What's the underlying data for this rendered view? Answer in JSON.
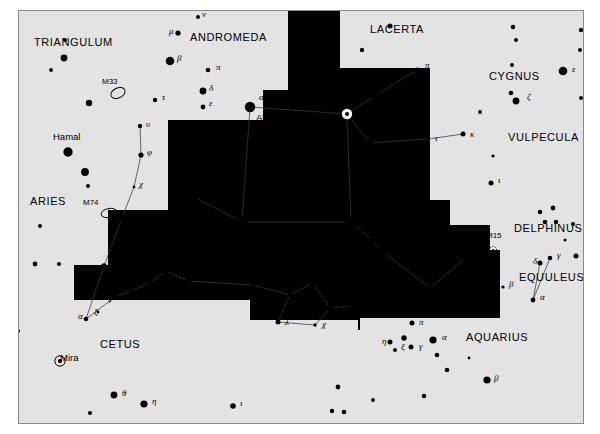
{
  "chart": {
    "frame": {
      "x": 18,
      "y": 10,
      "w": 566,
      "h": 414,
      "border_color": "#8a8a8a",
      "background": "#ffffff"
    },
    "milkyway_color": "#e3e3e3",
    "star_color": "#000000",
    "line_color": "#3a3a3a"
  },
  "constellations": [
    {
      "name": "TRIANGULUM",
      "x": 34,
      "y": 46
    },
    {
      "name": "ANDROMEDA",
      "x": 190,
      "y": 41
    },
    {
      "name": "LACERTA",
      "x": 370,
      "y": 33
    },
    {
      "name": "CYGNUS",
      "x": 489,
      "y": 80
    },
    {
      "name": "VULPECULA",
      "x": 508,
      "y": 141
    },
    {
      "name": "PEGASUS",
      "x": 366,
      "y": 193
    },
    {
      "name": "DELPHINUS",
      "x": 514,
      "y": 232
    },
    {
      "name": "EQUULEUS",
      "x": 519,
      "y": 281
    },
    {
      "name": "ARIES",
      "x": 30,
      "y": 205
    },
    {
      "name": "PISCES",
      "x": 163,
      "y": 220
    },
    {
      "name": "CETUS",
      "x": 100,
      "y": 348
    },
    {
      "name": "AQUARIUS",
      "x": 466,
      "y": 341
    }
  ],
  "named_stars": [
    {
      "name": "Alpheratz",
      "x": 256,
      "y": 121
    },
    {
      "name": "Markab",
      "x": 330,
      "y": 231
    },
    {
      "name": "Hamal",
      "x": 53,
      "y": 140
    },
    {
      "name": "Mira",
      "x": 60,
      "y": 361
    },
    {
      "name": "TX",
      "x": 277,
      "y": 313
    }
  ],
  "deep_sky_objects": [
    {
      "label": "M33",
      "x": 102,
      "y": 84,
      "mx": 118,
      "my": 93,
      "rx": 7.5,
      "ry": 5,
      "rot": -25,
      "kind": "galaxy"
    },
    {
      "label": "M74",
      "x": 83,
      "y": 205,
      "mx": 109,
      "my": 213,
      "rx": 8,
      "ry": 4.5,
      "rot": -12,
      "kind": "galaxy"
    },
    {
      "label": "M15",
      "x": 486,
      "y": 238,
      "mx": 493,
      "my": 250,
      "rx": 3.6,
      "ry": 3.6,
      "rot": 0,
      "kind": "cluster"
    }
  ],
  "greek_labels": [
    {
      "g": "ν",
      "x": 202,
      "y": 17
    },
    {
      "g": "μ",
      "x": 169,
      "y": 34
    },
    {
      "g": "β",
      "x": 177,
      "y": 61
    },
    {
      "g": "π",
      "x": 216,
      "y": 70
    },
    {
      "g": "δ",
      "x": 209,
      "y": 91
    },
    {
      "g": "ε",
      "x": 209,
      "y": 106
    },
    {
      "g": "τ",
      "x": 162,
      "y": 100
    },
    {
      "g": "υ",
      "x": 146,
      "y": 127
    },
    {
      "g": "φ",
      "x": 147,
      "y": 155
    },
    {
      "g": "χ",
      "x": 139,
      "y": 187
    },
    {
      "g": "η",
      "x": 129,
      "y": 218
    },
    {
      "g": "ο",
      "x": 112,
      "y": 266
    },
    {
      "g": "α",
      "x": 259,
      "y": 100
    },
    {
      "g": "β",
      "x": 345,
      "y": 102
    },
    {
      "g": "γ",
      "x": 234,
      "y": 222
    },
    {
      "g": "α",
      "x": 356,
      "y": 218
    },
    {
      "g": "π",
      "x": 425,
      "y": 68
    },
    {
      "g": "η",
      "x": 389,
      "y": 97
    },
    {
      "g": "μ",
      "x": 363,
      "y": 146
    },
    {
      "g": "λ",
      "x": 383,
      "y": 150
    },
    {
      "g": "ι",
      "x": 435,
      "y": 141
    },
    {
      "g": "κ",
      "x": 470,
      "y": 137
    },
    {
      "g": "ξ",
      "x": 379,
      "y": 240
    },
    {
      "g": "ζ",
      "x": 390,
      "y": 251
    },
    {
      "g": "θ",
      "x": 434,
      "y": 279
    },
    {
      "g": "ε",
      "x": 474,
      "y": 255
    },
    {
      "g": "ι",
      "x": 498,
      "y": 183
    },
    {
      "g": "ε",
      "x": 572,
      "y": 72
    },
    {
      "g": "ζ",
      "x": 527,
      "y": 100
    },
    {
      "g": "δ",
      "x": 533,
      "y": 264
    },
    {
      "g": "γ",
      "x": 557,
      "y": 258
    },
    {
      "g": "β",
      "x": 509,
      "y": 287
    },
    {
      "g": "α",
      "x": 540,
      "y": 300
    },
    {
      "g": "α",
      "x": 78,
      "y": 319
    },
    {
      "g": "ξ",
      "x": 94,
      "y": 315
    },
    {
      "g": "ν",
      "x": 108,
      "y": 303
    },
    {
      "g": "μ",
      "x": 127,
      "y": 298
    },
    {
      "g": "ζ",
      "x": 155,
      "y": 288
    },
    {
      "g": "ε",
      "x": 172,
      "y": 276
    },
    {
      "g": "δ",
      "x": 191,
      "y": 288
    },
    {
      "g": "ω",
      "x": 260,
      "y": 288
    },
    {
      "g": "ι",
      "x": 297,
      "y": 297
    },
    {
      "g": "θ",
      "x": 320,
      "y": 283
    },
    {
      "g": "λ",
      "x": 285,
      "y": 325
    },
    {
      "g": "χ",
      "x": 322,
      "y": 327
    },
    {
      "g": "γ",
      "x": 338,
      "y": 308
    },
    {
      "g": "β",
      "x": 357,
      "y": 308
    },
    {
      "g": "π",
      "x": 419,
      "y": 325
    },
    {
      "g": "η",
      "x": 382,
      "y": 344
    },
    {
      "g": "ξ",
      "x": 401,
      "y": 350
    },
    {
      "g": "γ",
      "x": 419,
      "y": 349
    },
    {
      "g": "α",
      "x": 442,
      "y": 340
    },
    {
      "g": "β",
      "x": 494,
      "y": 381
    },
    {
      "g": "θ",
      "x": 122,
      "y": 396
    },
    {
      "g": "η",
      "x": 152,
      "y": 404
    },
    {
      "g": "ι",
      "x": 240,
      "y": 406
    }
  ],
  "stars": [
    {
      "x": 198,
      "y": 17,
      "r": 2.0
    },
    {
      "x": 178,
      "y": 33,
      "r": 2.6
    },
    {
      "x": 170,
      "y": 61,
      "r": 4.3
    },
    {
      "x": 208,
      "y": 70,
      "r": 2.3
    },
    {
      "x": 203,
      "y": 91,
      "r": 3.4
    },
    {
      "x": 203,
      "y": 107,
      "r": 2.4
    },
    {
      "x": 155,
      "y": 100,
      "r": 2.2
    },
    {
      "x": 140,
      "y": 126,
      "r": 2.2
    },
    {
      "x": 141,
      "y": 155,
      "r": 2.6
    },
    {
      "x": 134,
      "y": 187,
      "r": 1.4
    },
    {
      "x": 122,
      "y": 218,
      "r": 3.5
    },
    {
      "x": 104,
      "y": 266,
      "r": 2.7
    },
    {
      "x": 65,
      "y": 40,
      "r": 2.0
    },
    {
      "x": 64,
      "y": 58,
      "r": 3.4
    },
    {
      "x": 51,
      "y": 70,
      "r": 1.9
    },
    {
      "x": 89,
      "y": 103,
      "r": 3.2
    },
    {
      "x": 68,
      "y": 152,
      "r": 4.7
    },
    {
      "x": 85,
      "y": 172,
      "r": 3.9
    },
    {
      "x": 88,
      "y": 186,
      "r": 2.0
    },
    {
      "x": 35,
      "y": 264,
      "r": 2.4
    },
    {
      "x": 59,
      "y": 264,
      "r": 2.0
    },
    {
      "x": 18,
      "y": 331,
      "r": 2.1
    },
    {
      "x": 250,
      "y": 107,
      "r": 5.2
    },
    {
      "x": 347,
      "y": 114,
      "r": 5.6
    },
    {
      "x": 242,
      "y": 222,
      "r": 5.2
    },
    {
      "x": 351,
      "y": 222,
      "r": 5.4
    },
    {
      "x": 376,
      "y": 95,
      "r": 4.1
    },
    {
      "x": 417,
      "y": 70,
      "r": 2.5
    },
    {
      "x": 370,
      "y": 143,
      "r": 3.0
    },
    {
      "x": 377,
      "y": 152,
      "r": 2.3
    },
    {
      "x": 428,
      "y": 139,
      "r": 2.2
    },
    {
      "x": 463,
      "y": 134,
      "r": 2.5
    },
    {
      "x": 372,
      "y": 240,
      "r": 2.6
    },
    {
      "x": 382,
      "y": 251,
      "r": 4.0
    },
    {
      "x": 430,
      "y": 288,
      "r": 2.8
    },
    {
      "x": 437,
      "y": 298,
      "r": 1.5
    },
    {
      "x": 467,
      "y": 257,
      "r": 5.0
    },
    {
      "x": 491,
      "y": 183,
      "r": 2.5
    },
    {
      "x": 390,
      "y": 26,
      "r": 2.5
    },
    {
      "x": 362,
      "y": 50,
      "r": 2.2
    },
    {
      "x": 513,
      "y": 27,
      "r": 2.3
    },
    {
      "x": 516,
      "y": 40,
      "r": 2.0
    },
    {
      "x": 512,
      "y": 65,
      "r": 2.0
    },
    {
      "x": 511,
      "y": 93,
      "r": 2.3
    },
    {
      "x": 516,
      "y": 101,
      "r": 3.4
    },
    {
      "x": 563,
      "y": 71,
      "r": 4.3
    },
    {
      "x": 581,
      "y": 30,
      "r": 2.2
    },
    {
      "x": 580,
      "y": 50,
      "r": 2.0
    },
    {
      "x": 581,
      "y": 98,
      "r": 2.0
    },
    {
      "x": 591,
      "y": 100,
      "r": 2.1
    },
    {
      "x": 493,
      "y": 156,
      "r": 1.6
    },
    {
      "x": 480,
      "y": 112,
      "r": 1.9
    },
    {
      "x": 540,
      "y": 212,
      "r": 2.3
    },
    {
      "x": 553,
      "y": 208,
      "r": 2.4
    },
    {
      "x": 545,
      "y": 222,
      "r": 2.3
    },
    {
      "x": 556,
      "y": 222,
      "r": 2.2
    },
    {
      "x": 573,
      "y": 224,
      "r": 2.1
    },
    {
      "x": 565,
      "y": 240,
      "r": 1.5
    },
    {
      "x": 576,
      "y": 256,
      "r": 2.5
    },
    {
      "x": 540,
      "y": 263,
      "r": 2.5
    },
    {
      "x": 550,
      "y": 258,
      "r": 2.3
    },
    {
      "x": 503,
      "y": 287,
      "r": 1.6
    },
    {
      "x": 533,
      "y": 300,
      "r": 2.4
    },
    {
      "x": 86,
      "y": 319,
      "r": 2.3
    },
    {
      "x": 98,
      "y": 312,
      "r": 1.4
    },
    {
      "x": 115,
      "y": 297,
      "r": 2.7
    },
    {
      "x": 131,
      "y": 291,
      "r": 1.6
    },
    {
      "x": 150,
      "y": 283,
      "r": 1.7
    },
    {
      "x": 166,
      "y": 271,
      "r": 3.0
    },
    {
      "x": 188,
      "y": 281,
      "r": 2.8
    },
    {
      "x": 253,
      "y": 285,
      "r": 2.2
    },
    {
      "x": 290,
      "y": 295,
      "r": 2.5
    },
    {
      "x": 313,
      "y": 283,
      "r": 3.0
    },
    {
      "x": 278,
      "y": 322,
      "r": 2.5
    },
    {
      "x": 315,
      "y": 325,
      "r": 1.7
    },
    {
      "x": 330,
      "y": 308,
      "r": 3.0
    },
    {
      "x": 350,
      "y": 306,
      "r": 2.6
    },
    {
      "x": 323,
      "y": 298,
      "r": 1.4
    },
    {
      "x": 412,
      "y": 323,
      "r": 2.5
    },
    {
      "x": 390,
      "y": 342,
      "r": 2.5
    },
    {
      "x": 404,
      "y": 338,
      "r": 2.7
    },
    {
      "x": 395,
      "y": 350,
      "r": 2.0
    },
    {
      "x": 411,
      "y": 347,
      "r": 2.5
    },
    {
      "x": 433,
      "y": 340,
      "r": 3.6
    },
    {
      "x": 437,
      "y": 355,
      "r": 2.3
    },
    {
      "x": 428,
      "y": 309,
      "r": 1.6
    },
    {
      "x": 487,
      "y": 380,
      "r": 3.6
    },
    {
      "x": 469,
      "y": 358,
      "r": 1.4
    },
    {
      "x": 424,
      "y": 396,
      "r": 2.2
    },
    {
      "x": 447,
      "y": 370,
      "r": 2.3
    },
    {
      "x": 60,
      "y": 361,
      "r": 2.0
    },
    {
      "x": 114,
      "y": 395,
      "r": 3.4
    },
    {
      "x": 144,
      "y": 404,
      "r": 3.6
    },
    {
      "x": 90,
      "y": 413,
      "r": 2.1
    },
    {
      "x": 233,
      "y": 406,
      "r": 2.8
    },
    {
      "x": 332,
      "y": 411,
      "r": 2.2
    },
    {
      "x": 344,
      "y": 412,
      "r": 2.3
    },
    {
      "x": 338,
      "y": 387,
      "r": 2.4
    },
    {
      "x": 373,
      "y": 400,
      "r": 1.9
    },
    {
      "x": 40,
      "y": 226,
      "r": 2.0
    },
    {
      "x": 196,
      "y": 198,
      "r": 1.3
    },
    {
      "x": 181,
      "y": 163,
      "r": 3.0
    },
    {
      "x": 197,
      "y": 158,
      "r": 3.2
    },
    {
      "x": 291,
      "y": 60,
      "r": 1.8
    }
  ],
  "lines": [
    [
      250,
      107,
      347,
      114
    ],
    [
      250,
      107,
      242,
      222
    ],
    [
      242,
      222,
      351,
      222
    ],
    [
      351,
      222,
      347,
      114
    ],
    [
      347,
      114,
      376,
      95
    ],
    [
      376,
      95,
      417,
      70
    ],
    [
      347,
      114,
      370,
      143
    ],
    [
      370,
      143,
      428,
      139
    ],
    [
      428,
      139,
      463,
      134
    ],
    [
      351,
      222,
      372,
      240
    ],
    [
      372,
      240,
      382,
      251
    ],
    [
      382,
      251,
      430,
      288
    ],
    [
      430,
      288,
      467,
      257
    ],
    [
      140,
      126,
      141,
      155
    ],
    [
      141,
      155,
      134,
      187
    ],
    [
      134,
      187,
      122,
      218
    ],
    [
      122,
      218,
      104,
      266
    ],
    [
      104,
      266,
      86,
      319
    ],
    [
      86,
      319,
      115,
      297
    ],
    [
      115,
      297,
      131,
      291
    ],
    [
      131,
      291,
      150,
      283
    ],
    [
      150,
      283,
      166,
      271
    ],
    [
      166,
      271,
      188,
      281
    ],
    [
      188,
      281,
      253,
      285
    ],
    [
      253,
      285,
      290,
      295
    ],
    [
      290,
      295,
      313,
      283
    ],
    [
      290,
      295,
      278,
      322
    ],
    [
      278,
      322,
      315,
      325
    ],
    [
      315,
      325,
      330,
      308
    ],
    [
      330,
      308,
      313,
      283
    ],
    [
      330,
      308,
      350,
      306
    ],
    [
      540,
      263,
      533,
      300
    ],
    [
      550,
      258,
      533,
      300
    ],
    [
      242,
      222,
      196,
      198
    ]
  ],
  "milkyway_patches": [
    {
      "x": 18,
      "y": 10,
      "w": 200,
      "h": 48
    },
    {
      "x": 18,
      "y": 10,
      "w": 150,
      "h": 200
    },
    {
      "x": 18,
      "y": 58,
      "w": 112,
      "h": 152
    },
    {
      "x": 18,
      "y": 210,
      "w": 90,
      "h": 55
    },
    {
      "x": 130,
      "y": 10,
      "w": 110,
      "h": 50
    },
    {
      "x": 168,
      "y": 10,
      "w": 95,
      "h": 110
    },
    {
      "x": 218,
      "y": 10,
      "w": 70,
      "h": 80
    },
    {
      "x": 18,
      "y": 265,
      "w": 56,
      "h": 40
    },
    {
      "x": 18,
      "y": 300,
      "w": 230,
      "h": 124
    },
    {
      "x": 18,
      "y": 320,
      "w": 340,
      "h": 104
    },
    {
      "x": 100,
      "y": 300,
      "w": 150,
      "h": 124
    },
    {
      "x": 340,
      "y": 10,
      "w": 110,
      "h": 58
    },
    {
      "x": 430,
      "y": 10,
      "w": 154,
      "h": 190
    },
    {
      "x": 450,
      "y": 10,
      "w": 134,
      "h": 215
    },
    {
      "x": 490,
      "y": 140,
      "w": 94,
      "h": 110
    },
    {
      "x": 500,
      "y": 195,
      "w": 84,
      "h": 130
    },
    {
      "x": 360,
      "y": 318,
      "w": 224,
      "h": 106
    },
    {
      "x": 250,
      "y": 330,
      "w": 334,
      "h": 94
    },
    {
      "x": 268,
      "y": 320,
      "w": 40,
      "h": 20
    }
  ],
  "legend": {
    "galaxy_symbol": "ellipse-outline",
    "cluster_symbol": "dotted-circle",
    "variable_symbol": "circle-with-dot"
  }
}
